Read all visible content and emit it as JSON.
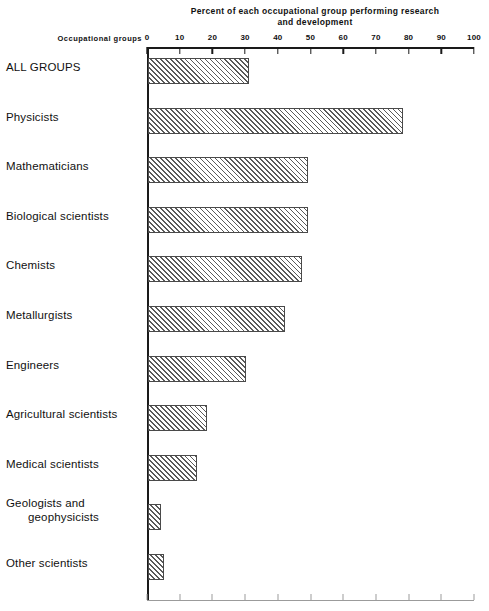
{
  "chart_data": {
    "type": "bar",
    "orientation": "horizontal",
    "title": "Percent of each occupational group performing research and development",
    "title_line1": "Percent of each occupational group performing research",
    "title_line2": "and development",
    "xlabel": "",
    "ylabel": "Occupational groups",
    "xlim": [
      0,
      100
    ],
    "grid": false,
    "legend": null,
    "tick_labels": [
      "0",
      "10",
      "20",
      "30",
      "40",
      "50",
      "60",
      "70",
      "80",
      "90",
      "100"
    ],
    "tick_values": [
      0,
      10,
      20,
      30,
      40,
      50,
      60,
      70,
      80,
      90,
      100
    ],
    "categories": [
      "ALL GROUPS",
      "Physicists",
      "Mathematicians",
      "Biological scientists",
      "Chemists",
      "Metallurgists",
      "Engineers",
      "Agricultural scientists",
      "Medical scientists",
      "Geologists and geophysicists",
      "Other scientists"
    ],
    "values": [
      31,
      78,
      49,
      49,
      47,
      42,
      30,
      18,
      15,
      4,
      5
    ],
    "bars": [
      {
        "label": "ALL GROUPS",
        "label_line1": "ALL GROUPS",
        "label_line2": "",
        "value": 31
      },
      {
        "label": "Physicists",
        "label_line1": "Physicists",
        "label_line2": "",
        "value": 78
      },
      {
        "label": "Mathematicians",
        "label_line1": "Mathematicians",
        "label_line2": "",
        "value": 49
      },
      {
        "label": "Biological scientists",
        "label_line1": "Biological scientists",
        "label_line2": "",
        "value": 49
      },
      {
        "label": "Chemists",
        "label_line1": "Chemists",
        "label_line2": "",
        "value": 47
      },
      {
        "label": "Metallurgists",
        "label_line1": "Metallurgists",
        "label_line2": "",
        "value": 42
      },
      {
        "label": "Engineers",
        "label_line1": "Engineers",
        "label_line2": "",
        "value": 30
      },
      {
        "label": "Agricultural scientists",
        "label_line1": "Agricultural scientists",
        "label_line2": "",
        "value": 18
      },
      {
        "label": "Medical scientists",
        "label_line1": "Medical scientists",
        "label_line2": "",
        "value": 15
      },
      {
        "label": "Geologists and geophysicists",
        "label_line1": "Geologists and",
        "label_line2": "geophysicists",
        "value": 4
      },
      {
        "label": "Other scientists",
        "label_line1": "Other scientists",
        "label_line2": "",
        "value": 5
      }
    ]
  },
  "axis_header": "Occupational groups",
  "colors": {
    "bar_border": "#4a4a4a",
    "bar_hatch": "#5a5a5a",
    "axis": "#1a1a1a",
    "text": "#111111",
    "background": "#ffffff"
  }
}
